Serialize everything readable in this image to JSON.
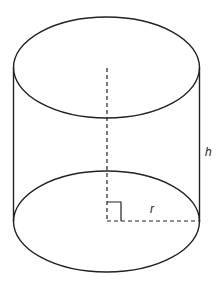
{
  "diagram": {
    "type": "cylinder",
    "labels": {
      "height": "h",
      "radius": "r"
    },
    "colors": {
      "stroke": "#222222",
      "background": "#ffffff"
    },
    "features": {
      "top_face": "ellipse",
      "bottom_face": "ellipse",
      "axis": "dashed vertical line from top center to bottom center",
      "radius_line": "dashed horizontal line from bottom center to right edge",
      "right_angle_marker": true
    }
  }
}
